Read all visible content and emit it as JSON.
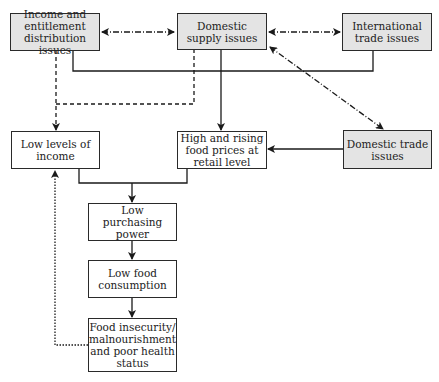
{
  "diagram": {
    "colors": {
      "issue_fill": "#e4e4e4",
      "outcome_fill": "#ffffff",
      "stroke": "#2a2a2a"
    },
    "nodes": {
      "income": {
        "label": "Income and entitlement distribution issues",
        "type": "issue"
      },
      "domestic_supply": {
        "label": "Domestic supply issues",
        "type": "issue"
      },
      "international_trade": {
        "label": "International trade issues",
        "type": "issue"
      },
      "low_income": {
        "label": "Low levels of income",
        "type": "outcome"
      },
      "high_prices": {
        "label": "High and rising food prices at retail level",
        "type": "outcome"
      },
      "domestic_trade": {
        "label": "Domestic trade issues",
        "type": "issue"
      },
      "low_purchasing": {
        "label": "Low purchasing power",
        "type": "outcome"
      },
      "low_consumption": {
        "label": "Low food consumption",
        "type": "outcome"
      },
      "food_insecurity": {
        "label": "Food insecurity/ malnourishment and poor health status",
        "type": "outcome"
      }
    },
    "edges": [
      {
        "from": "income",
        "to": "domestic_supply",
        "style": "dash-dot",
        "direction": "both"
      },
      {
        "from": "domestic_supply",
        "to": "international_trade",
        "style": "dash-dot",
        "direction": "both"
      },
      {
        "from": "domestic_supply",
        "to": "domestic_trade",
        "style": "dash-dot",
        "direction": "both"
      },
      {
        "from": "income",
        "to": "international_trade",
        "style": "solid",
        "direction": "none"
      },
      {
        "from": "income",
        "to": "low_income",
        "style": "dashed",
        "direction": "forward"
      },
      {
        "from": "domestic_supply",
        "to": "low_income",
        "style": "dashed",
        "direction": "forward"
      },
      {
        "from": "domestic_supply",
        "to": "high_prices",
        "style": "solid",
        "direction": "forward"
      },
      {
        "from": "domestic_trade",
        "to": "high_prices",
        "style": "solid",
        "direction": "forward"
      },
      {
        "from": "low_income",
        "to": "low_purchasing",
        "style": "solid",
        "direction": "forward"
      },
      {
        "from": "high_prices",
        "to": "low_purchasing",
        "style": "solid",
        "direction": "forward"
      },
      {
        "from": "low_purchasing",
        "to": "low_consumption",
        "style": "solid",
        "direction": "forward"
      },
      {
        "from": "low_consumption",
        "to": "food_insecurity",
        "style": "solid",
        "direction": "forward"
      },
      {
        "from": "food_insecurity",
        "to": "low_income",
        "style": "dotted",
        "direction": "forward"
      }
    ]
  }
}
